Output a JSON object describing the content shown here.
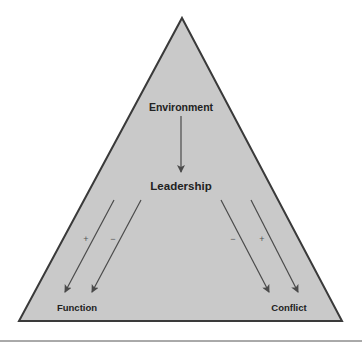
{
  "diagram": {
    "shape": "triangle",
    "fill_color": "#c9c9c9",
    "stroke_color": "#3a3a3a",
    "arrow_color": "#4a4a4a",
    "nodes": {
      "environment": "Environment",
      "leadership": "Leadership",
      "function": "Function",
      "conflict": "Conflict"
    },
    "edges": [
      {
        "from": "Environment",
        "to": "Leadership",
        "sign": ""
      },
      {
        "from": "Leadership",
        "to": "Function",
        "sign": "+"
      },
      {
        "from": "Leadership",
        "to": "Function",
        "sign": "−"
      },
      {
        "from": "Leadership",
        "to": "Conflict",
        "sign": "−"
      },
      {
        "from": "Leadership",
        "to": "Conflict",
        "sign": "+"
      }
    ],
    "signs": {
      "function_left": "+",
      "function_right": "−",
      "conflict_left": "−",
      "conflict_right": "+"
    }
  }
}
